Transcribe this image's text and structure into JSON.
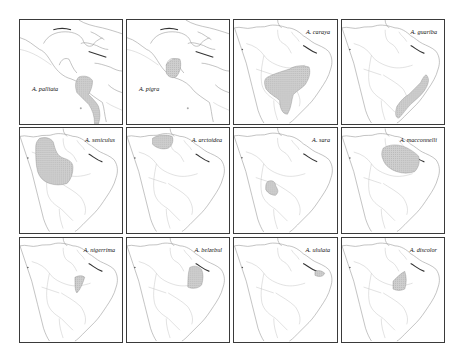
{
  "figure": {
    "type": "species distribution map grid",
    "genus": "Alouatta",
    "rows": 3,
    "columns": 4,
    "range_fill_color": "#c8c8c8",
    "panels": [
      {
        "id": "palliata",
        "label": "A. palliata",
        "region": "Central America",
        "range": "Southern Mexico through Central America to western Colombia/Ecuador coast"
      },
      {
        "id": "pigra",
        "label": "A. pigra",
        "region": "Central America",
        "range": "Yucatan Peninsula, Belize, Guatemala"
      },
      {
        "id": "caraya",
        "label": "A. caraya",
        "region": "South America",
        "range": "Central Brazil, Paraguay, Bolivia, northern Argentina"
      },
      {
        "id": "guariba",
        "label": "A. guariba",
        "region": "South America",
        "range": "Atlantic coastal forest of eastern Brazil"
      },
      {
        "id": "seniculus",
        "label": "A. seniculus",
        "region": "South America",
        "range": "Northwestern South America, western Amazon"
      },
      {
        "id": "arctoidea",
        "label": "A. arctoidea",
        "region": "South America",
        "range": "Northern Venezuela"
      },
      {
        "id": "sara",
        "label": "A. sara",
        "region": "South America",
        "range": "Bolivia"
      },
      {
        "id": "macconnelli",
        "label": "A. macconnelli",
        "region": "South America",
        "range": "Guianas and northeastern Amazon"
      },
      {
        "id": "nigerrima",
        "label": "A. nigerrima",
        "region": "South America",
        "range": "Central Amazon, south of the Amazon River"
      },
      {
        "id": "belzebul",
        "label": "A. belzebul",
        "region": "South America",
        "range": "Eastern Amazon, northeastern Brazil"
      },
      {
        "id": "ululata",
        "label": "A. ululata",
        "region": "South America",
        "range": "Coastal Maranhão, northeastern Brazil"
      },
      {
        "id": "discolor",
        "label": "A. discolor",
        "region": "South America",
        "range": "Southeastern Amazon between Tapajós and Tocantins"
      }
    ]
  }
}
